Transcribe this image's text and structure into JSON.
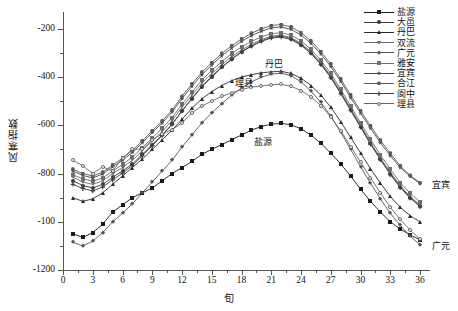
{
  "chart_data": {
    "type": "line",
    "title": "",
    "xlabel": "旬",
    "ylabel": "风寒指数",
    "xlim": [
      0,
      37
    ],
    "ylim": [
      -1200,
      -100
    ],
    "yticks": [
      -200,
      -400,
      -600,
      -800,
      -100,
      -1200
    ],
    "ytick_labels": [
      "-200",
      "-400",
      "-600",
      "-800",
      "-100",
      "-1200"
    ],
    "xticks": [
      0,
      3,
      6,
      9,
      12,
      15,
      18,
      21,
      24,
      27,
      30,
      33,
      36
    ],
    "xtick_labels": [
      "0",
      "3",
      "6",
      "9",
      "12",
      "15",
      "18",
      "21",
      "24",
      "27",
      "30",
      "33",
      "36"
    ],
    "grid": false,
    "legend_position": "top-right",
    "x": [
      1,
      2,
      3,
      4,
      5,
      6,
      7,
      8,
      9,
      10,
      11,
      12,
      13,
      14,
      15,
      16,
      17,
      18,
      19,
      20,
      21,
      22,
      23,
      24,
      25,
      26,
      27,
      28,
      29,
      30,
      31,
      32,
      33,
      34,
      35,
      36
    ],
    "series": [
      {
        "name": "盐源",
        "marker": "square",
        "color": "#1a1a1a",
        "values": [
          -1050,
          -1065,
          -1045,
          -1010,
          -960,
          -930,
          -900,
          -880,
          -860,
          -830,
          -800,
          -775,
          -750,
          -720,
          -700,
          -680,
          -660,
          -640,
          -620,
          -605,
          -595,
          -592,
          -598,
          -615,
          -640,
          -675,
          -715,
          -760,
          -810,
          -865,
          -915,
          -960,
          -1000,
          -1030,
          -1055,
          -1075
        ]
      },
      {
        "name": "大邑",
        "marker": "circle",
        "color": "#3a3a3a",
        "values": [
          -830,
          -850,
          -860,
          -845,
          -815,
          -790,
          -760,
          -720,
          -680,
          -640,
          -595,
          -540,
          -490,
          -440,
          -400,
          -360,
          -325,
          -295,
          -270,
          -250,
          -235,
          -230,
          -240,
          -265,
          -300,
          -345,
          -400,
          -465,
          -535,
          -605,
          -675,
          -740,
          -800,
          -855,
          -900,
          -935
        ]
      },
      {
        "name": "丹巴",
        "marker": "triangle",
        "color": "#2a2a2a",
        "values": [
          -900,
          -915,
          -905,
          -880,
          -845,
          -810,
          -775,
          -740,
          -700,
          -660,
          -620,
          -575,
          -530,
          -490,
          -460,
          -435,
          -415,
          -400,
          -390,
          -382,
          -378,
          -376,
          -385,
          -405,
          -435,
          -475,
          -525,
          -585,
          -650,
          -715,
          -780,
          -840,
          -895,
          -940,
          -975,
          -1000
        ]
      },
      {
        "name": "双流",
        "marker": "dtriangle",
        "color": "#6a6a6a",
        "values": [
          -815,
          -835,
          -845,
          -830,
          -800,
          -775,
          -745,
          -705,
          -665,
          -625,
          -580,
          -525,
          -475,
          -425,
          -385,
          -348,
          -315,
          -288,
          -263,
          -245,
          -230,
          -226,
          -236,
          -260,
          -295,
          -340,
          -395,
          -460,
          -530,
          -600,
          -670,
          -735,
          -795,
          -850,
          -895,
          -930
        ]
      },
      {
        "name": "广元",
        "marker": "diamond",
        "color": "#555555",
        "values": [
          -1085,
          -1100,
          -1080,
          -1045,
          -1000,
          -965,
          -925,
          -880,
          -835,
          -790,
          -745,
          -690,
          -640,
          -590,
          -548,
          -510,
          -475,
          -445,
          -420,
          -400,
          -388,
          -384,
          -394,
          -420,
          -458,
          -505,
          -562,
          -628,
          -700,
          -772,
          -840,
          -905,
          -965,
          -1015,
          -1060,
          -1095
        ]
      },
      {
        "name": "雅安",
        "marker": "lsquare",
        "color": "#6e6e6e",
        "values": [
          -805,
          -822,
          -832,
          -818,
          -790,
          -762,
          -732,
          -692,
          -652,
          -612,
          -568,
          -512,
          -462,
          -412,
          -372,
          -336,
          -302,
          -275,
          -252,
          -233,
          -220,
          -216,
          -226,
          -250,
          -285,
          -330,
          -385,
          -450,
          -520,
          -590,
          -658,
          -722,
          -782,
          -838,
          -882,
          -918
        ]
      },
      {
        "name": "宜宾",
        "marker": "star",
        "color": "#4a4a4a",
        "values": [
          -790,
          -808,
          -818,
          -802,
          -772,
          -745,
          -712,
          -672,
          -630,
          -590,
          -545,
          -490,
          -438,
          -390,
          -350,
          -312,
          -280,
          -252,
          -228,
          -210,
          -196,
          -192,
          -202,
          -226,
          -260,
          -304,
          -356,
          -418,
          -485,
          -550,
          -612,
          -672,
          -726,
          -775,
          -812,
          -842
        ]
      },
      {
        "name": "合江",
        "marker": "hex",
        "color": "#5a5a5a",
        "values": [
          -782,
          -800,
          -810,
          -795,
          -765,
          -736,
          -704,
          -664,
          -622,
          -582,
          -536,
          -480,
          -428,
          -380,
          -340,
          -302,
          -270,
          -242,
          -218,
          -200,
          -186,
          -182,
          -192,
          -216,
          -250,
          -294,
          -346,
          -408,
          -474,
          -540,
          -602,
          -662,
          -716,
          -768,
          -808,
          -838
        ]
      },
      {
        "name": "阆中",
        "marker": "plus",
        "color": "#3f3f3f",
        "values": [
          -845,
          -862,
          -872,
          -856,
          -826,
          -798,
          -766,
          -726,
          -684,
          -642,
          -596,
          -540,
          -488,
          -438,
          -396,
          -358,
          -326,
          -296,
          -272,
          -252,
          -238,
          -234,
          -244,
          -268,
          -302,
          -348,
          -402,
          -468,
          -538,
          -608,
          -678,
          -742,
          -804,
          -858,
          -902,
          -938
        ]
      },
      {
        "name": "理县",
        "marker": "ring",
        "color": "#666666",
        "values": [
          -745,
          -768,
          -800,
          -772,
          -790,
          -735,
          -700,
          -698,
          -660,
          -635,
          -618,
          -590,
          -548,
          -520,
          -500,
          -480,
          -466,
          -452,
          -442,
          -436,
          -432,
          -430,
          -438,
          -456,
          -482,
          -518,
          -566,
          -622,
          -688,
          -752,
          -818,
          -880,
          -940,
          -990,
          -1035,
          -1072
        ]
      }
    ],
    "annotations": [
      {
        "text": "丹巴",
        "x": 20.2,
        "y": -392,
        "dx": 2,
        "dy": -12
      },
      {
        "text": "理县",
        "x": 17.5,
        "y": -470,
        "dx": -2,
        "dy": -12
      },
      {
        "text": "盐源",
        "x": 19.5,
        "y": -600,
        "dx": -2,
        "dy": 16
      },
      {
        "text": "宜宾",
        "x": 36.6,
        "y": -842,
        "dx": 6,
        "dy": 0
      },
      {
        "text": "广元",
        "x": 36.6,
        "y": -1095,
        "dx": 6,
        "dy": 0
      }
    ]
  }
}
